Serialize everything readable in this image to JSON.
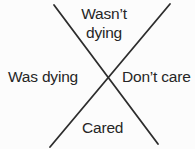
{
  "diagram": {
    "type": "x-quadrant-diagram",
    "labels": {
      "top": "Wasn’t dying",
      "left": "Was dying",
      "right": "Don’t care",
      "bottom": "Cared"
    },
    "colors": {
      "line": "#2d2d2d",
      "text": "#262626",
      "background": "#fcfcfc"
    }
  }
}
